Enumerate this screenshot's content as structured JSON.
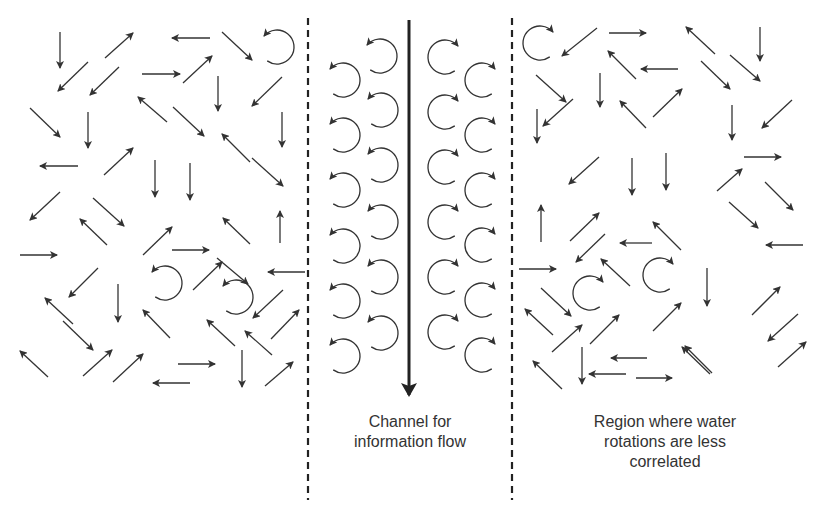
{
  "colors": {
    "stroke": "#333333",
    "background": "#ffffff"
  },
  "labels": {
    "channel": "Channel for\ninformation flow",
    "region": "Region where water\nrotations are less\ncorrelated"
  },
  "dividers": [
    {
      "x": 308,
      "y1": 18,
      "y2": 500
    },
    {
      "x": 512,
      "y1": 18,
      "y2": 500
    }
  ],
  "main_arrow": {
    "x": 409,
    "y1": 20,
    "y2": 395
  },
  "arrows": [
    [
      60,
      32,
      60,
      68
    ],
    [
      105,
      58,
      133,
      33
    ],
    [
      210,
      38,
      172,
      38
    ],
    [
      222,
      32,
      252,
      60
    ],
    [
      88,
      62,
      58,
      91
    ],
    [
      119,
      67,
      90,
      95
    ],
    [
      142,
      74,
      180,
      74
    ],
    [
      183,
      83,
      212,
      56
    ],
    [
      218,
      76,
      218,
      111
    ],
    [
      282,
      77,
      252,
      106
    ],
    [
      30,
      108,
      60,
      137
    ],
    [
      88,
      112,
      88,
      148
    ],
    [
      167,
      122,
      138,
      97
    ],
    [
      173,
      107,
      204,
      136
    ],
    [
      282,
      112,
      282,
      147
    ],
    [
      250,
      162,
      222,
      134
    ],
    [
      78,
      166,
      40,
      166
    ],
    [
      104,
      175,
      133,
      148
    ],
    [
      155,
      160,
      155,
      197
    ],
    [
      190,
      163,
      190,
      200
    ],
    [
      252,
      158,
      283,
      186
    ],
    [
      60,
      192,
      30,
      220
    ],
    [
      93,
      198,
      124,
      226
    ],
    [
      107,
      245,
      80,
      219
    ],
    [
      143,
      255,
      172,
      227
    ],
    [
      172,
      250,
      209,
      250
    ],
    [
      250,
      244,
      223,
      218
    ],
    [
      217,
      258,
      248,
      284
    ],
    [
      280,
      243,
      280,
      211
    ],
    [
      20,
      255,
      57,
      255
    ],
    [
      98,
      268,
      69,
      297
    ],
    [
      118,
      284,
      118,
      322
    ],
    [
      193,
      290,
      222,
      262
    ],
    [
      305,
      272,
      268,
      272
    ],
    [
      283,
      290,
      253,
      318
    ],
    [
      271,
      339,
      299,
      310
    ],
    [
      73,
      324,
      45,
      298
    ],
    [
      63,
      321,
      93,
      350
    ],
    [
      170,
      338,
      143,
      310
    ],
    [
      235,
      346,
      207,
      320
    ],
    [
      272,
      355,
      245,
      331
    ],
    [
      242,
      350,
      242,
      387
    ],
    [
      48,
      377,
      20,
      351
    ],
    [
      83,
      376,
      112,
      350
    ],
    [
      113,
      382,
      143,
      354
    ],
    [
      265,
      386,
      293,
      362
    ],
    [
      178,
      364,
      215,
      364
    ],
    [
      190,
      383,
      153,
      383
    ],
    [
      597,
      28,
      562,
      56
    ],
    [
      609,
      33,
      646,
      33
    ],
    [
      715,
      54,
      686,
      27
    ],
    [
      760,
      27,
      760,
      61
    ],
    [
      536,
      75,
      566,
      102
    ],
    [
      600,
      73,
      600,
      107
    ],
    [
      636,
      79,
      608,
      51
    ],
    [
      678,
      69,
      641,
      69
    ],
    [
      701,
      61,
      730,
      89
    ],
    [
      730,
      55,
      760,
      81
    ],
    [
      792,
      100,
      762,
      128
    ],
    [
      537,
      109,
      537,
      143
    ],
    [
      573,
      99,
      543,
      126
    ],
    [
      653,
      117,
      682,
      89
    ],
    [
      732,
      105,
      732,
      140
    ],
    [
      646,
      128,
      620,
      101
    ],
    [
      599,
      157,
      569,
      184
    ],
    [
      632,
      158,
      632,
      195
    ],
    [
      666,
      153,
      666,
      190
    ],
    [
      744,
      157,
      781,
      157
    ],
    [
      765,
      182,
      793,
      210
    ],
    [
      541,
      242,
      541,
      205
    ],
    [
      570,
      241,
      599,
      213
    ],
    [
      605,
      234,
      576,
      262
    ],
    [
      652,
      243,
      620,
      243
    ],
    [
      681,
      250,
      653,
      222
    ],
    [
      717,
      191,
      742,
      169
    ],
    [
      729,
      202,
      758,
      228
    ],
    [
      803,
      245,
      766,
      245
    ],
    [
      519,
      269,
      556,
      269
    ],
    [
      630,
      286,
      601,
      259
    ],
    [
      707,
      268,
      707,
      306
    ],
    [
      752,
      315,
      780,
      287
    ],
    [
      541,
      288,
      571,
      316
    ],
    [
      553,
      335,
      525,
      309
    ],
    [
      552,
      352,
      582,
      325
    ],
    [
      590,
      344,
      619,
      315
    ],
    [
      653,
      331,
      681,
      303
    ],
    [
      798,
      314,
      768,
      341
    ],
    [
      582,
      347,
      582,
      384
    ],
    [
      647,
      358,
      611,
      358
    ],
    [
      562,
      389,
      533,
      361
    ],
    [
      712,
      373,
      685,
      346
    ],
    [
      778,
      367,
      806,
      342
    ],
    [
      626,
      374,
      589,
      374
    ],
    [
      710,
      374,
      682,
      347
    ],
    [
      636,
      378,
      672,
      378
    ]
  ],
  "rotors": [
    {
      "cx": 277,
      "cy": 47,
      "r": 17,
      "dir": "ccw",
      "start": 140,
      "end": -170
    },
    {
      "cx": 165,
      "cy": 283,
      "r": 17,
      "dir": "ccw",
      "start": 140,
      "end": -170
    },
    {
      "cx": 236,
      "cy": 297,
      "r": 17,
      "dir": "ccw",
      "start": 140,
      "end": -170
    },
    {
      "cx": 540,
      "cy": 43,
      "r": 17,
      "dir": "cw",
      "start": 40,
      "end": -150
    },
    {
      "cx": 590,
      "cy": 293,
      "r": 17,
      "dir": "cw",
      "start": 40,
      "end": -150
    },
    {
      "cx": 660,
      "cy": 275,
      "r": 17,
      "dir": "cw",
      "start": 40,
      "end": -150
    },
    {
      "cx": 380,
      "cy": 56,
      "r": 17,
      "dir": "ccw",
      "start": 140,
      "end": -170
    },
    {
      "cx": 343,
      "cy": 80,
      "r": 17,
      "dir": "ccw",
      "start": 140,
      "end": -170
    },
    {
      "cx": 381,
      "cy": 110,
      "r": 17,
      "dir": "ccw",
      "start": 140,
      "end": -170
    },
    {
      "cx": 343,
      "cy": 135,
      "r": 17,
      "dir": "ccw",
      "start": 140,
      "end": -170
    },
    {
      "cx": 381,
      "cy": 165,
      "r": 17,
      "dir": "ccw",
      "start": 140,
      "end": -170
    },
    {
      "cx": 343,
      "cy": 190,
      "r": 17,
      "dir": "ccw",
      "start": 140,
      "end": -170
    },
    {
      "cx": 381,
      "cy": 222,
      "r": 17,
      "dir": "ccw",
      "start": 140,
      "end": -170
    },
    {
      "cx": 343,
      "cy": 246,
      "r": 17,
      "dir": "ccw",
      "start": 140,
      "end": -170
    },
    {
      "cx": 381,
      "cy": 277,
      "r": 17,
      "dir": "ccw",
      "start": 140,
      "end": -170
    },
    {
      "cx": 343,
      "cy": 301,
      "r": 17,
      "dir": "ccw",
      "start": 140,
      "end": -170
    },
    {
      "cx": 381,
      "cy": 333,
      "r": 17,
      "dir": "ccw",
      "start": 140,
      "end": -170
    },
    {
      "cx": 343,
      "cy": 356,
      "r": 17,
      "dir": "ccw",
      "start": 140,
      "end": -170
    },
    {
      "cx": 445,
      "cy": 57,
      "r": 17,
      "dir": "cw",
      "start": 40,
      "end": -150
    },
    {
      "cx": 482,
      "cy": 80,
      "r": 17,
      "dir": "cw",
      "start": 40,
      "end": -150
    },
    {
      "cx": 445,
      "cy": 112,
      "r": 17,
      "dir": "cw",
      "start": 40,
      "end": -150
    },
    {
      "cx": 482,
      "cy": 135,
      "r": 17,
      "dir": "cw",
      "start": 40,
      "end": -150
    },
    {
      "cx": 445,
      "cy": 167,
      "r": 17,
      "dir": "cw",
      "start": 40,
      "end": -150
    },
    {
      "cx": 482,
      "cy": 190,
      "r": 17,
      "dir": "cw",
      "start": 40,
      "end": -150
    },
    {
      "cx": 445,
      "cy": 222,
      "r": 17,
      "dir": "cw",
      "start": 40,
      "end": -150
    },
    {
      "cx": 482,
      "cy": 245,
      "r": 17,
      "dir": "cw",
      "start": 40,
      "end": -150
    },
    {
      "cx": 445,
      "cy": 277,
      "r": 17,
      "dir": "cw",
      "start": 40,
      "end": -150
    },
    {
      "cx": 482,
      "cy": 300,
      "r": 17,
      "dir": "cw",
      "start": 40,
      "end": -150
    },
    {
      "cx": 445,
      "cy": 332,
      "r": 17,
      "dir": "cw",
      "start": 40,
      "end": -150
    },
    {
      "cx": 482,
      "cy": 355,
      "r": 17,
      "dir": "cw",
      "start": 40,
      "end": -150
    }
  ]
}
